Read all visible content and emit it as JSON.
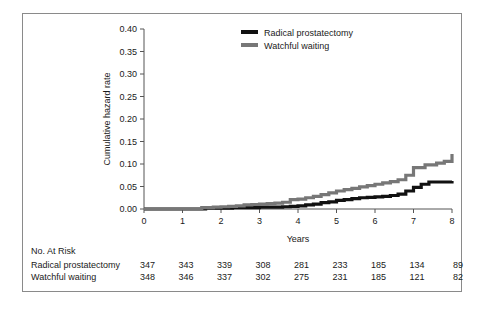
{
  "chart_data": {
    "type": "line",
    "title": "",
    "xlabel": "Years",
    "ylabel": "Cumulative hazard rate",
    "xlim": [
      0,
      8
    ],
    "ylim": [
      0,
      0.4
    ],
    "xticks": [
      "0",
      "1",
      "2",
      "3",
      "4",
      "5",
      "6",
      "7",
      "8"
    ],
    "yticks": [
      "0.00",
      "0.05",
      "0.10",
      "0.15",
      "0.20",
      "0.25",
      "0.30",
      "0.35",
      "0.40"
    ],
    "grid": false,
    "legend_position": "top-right",
    "step_style": "post",
    "series": [
      {
        "name": "Radical prostatectomy",
        "color": "#111111",
        "x": [
          0,
          1.3,
          1.6,
          2.0,
          2.3,
          2.6,
          3.0,
          3.4,
          3.6,
          3.8,
          4.0,
          4.2,
          4.4,
          4.6,
          4.8,
          5.0,
          5.2,
          5.4,
          5.6,
          5.8,
          6.0,
          6.2,
          6.4,
          6.6,
          6.8,
          7.0,
          7.2,
          7.4,
          8.0
        ],
        "y": [
          0.0,
          0.0,
          0.002,
          0.002,
          0.003,
          0.003,
          0.004,
          0.004,
          0.005,
          0.006,
          0.007,
          0.009,
          0.011,
          0.014,
          0.016,
          0.019,
          0.021,
          0.023,
          0.025,
          0.026,
          0.027,
          0.028,
          0.03,
          0.033,
          0.04,
          0.048,
          0.055,
          0.06,
          0.062
        ]
      },
      {
        "name": "Watchful waiting",
        "color": "#777777",
        "x": [
          0,
          1.3,
          1.5,
          1.8,
          2.0,
          2.2,
          2.4,
          2.6,
          2.8,
          3.0,
          3.2,
          3.4,
          3.6,
          3.8,
          4.0,
          4.2,
          4.4,
          4.6,
          4.8,
          5.0,
          5.2,
          5.4,
          5.6,
          5.8,
          6.0,
          6.2,
          6.4,
          6.6,
          6.8,
          7.0,
          7.3,
          7.6,
          7.8,
          8.0
        ],
        "y": [
          0.0,
          0.0,
          0.003,
          0.004,
          0.005,
          0.006,
          0.007,
          0.009,
          0.01,
          0.011,
          0.012,
          0.013,
          0.015,
          0.021,
          0.022,
          0.025,
          0.028,
          0.032,
          0.036,
          0.04,
          0.043,
          0.046,
          0.049,
          0.052,
          0.055,
          0.058,
          0.061,
          0.065,
          0.075,
          0.092,
          0.098,
          0.102,
          0.106,
          0.122
        ]
      }
    ]
  },
  "legend": {
    "items": [
      {
        "label": "Radical prostatectomy",
        "color": "#111111"
      },
      {
        "label": "Watchful waiting",
        "color": "#777777"
      }
    ]
  },
  "risk_table": {
    "heading": "No. At Risk",
    "rows": [
      {
        "label": "Radical prostatectomy",
        "values": [
          "347",
          "343",
          "339",
          "308",
          "281",
          "233",
          "185",
          "134",
          "89"
        ]
      },
      {
        "label": "Watchful waiting",
        "values": [
          "348",
          "346",
          "337",
          "302",
          "275",
          "231",
          "185",
          "121",
          "82"
        ]
      }
    ]
  }
}
